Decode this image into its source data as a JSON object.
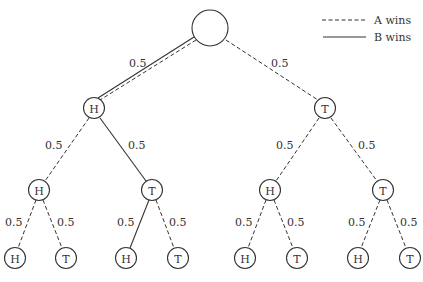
{
  "legend": {
    "items": [
      {
        "label": "A wins",
        "style": "dashed"
      },
      {
        "label": "B wins",
        "style": "solid"
      }
    ]
  },
  "tree": {
    "root": {
      "label": ""
    },
    "level1": [
      {
        "label": "H",
        "edge_prob": "0.5"
      },
      {
        "label": "T",
        "edge_prob": "0.5"
      }
    ],
    "level2": [
      {
        "label": "H",
        "edge_prob": "0.5"
      },
      {
        "label": "T",
        "edge_prob": "0.5"
      },
      {
        "label": "H",
        "edge_prob": "0.5"
      },
      {
        "label": "T",
        "edge_prob": "0.5"
      }
    ],
    "level3": [
      {
        "label": "H",
        "edge_prob": "0.5"
      },
      {
        "label": "T",
        "edge_prob": "0.5"
      },
      {
        "label": "H",
        "edge_prob": "0.5"
      },
      {
        "label": "T",
        "edge_prob": "0.5"
      },
      {
        "label": "H",
        "edge_prob": "0.5"
      },
      {
        "label": "T",
        "edge_prob": "0.5"
      },
      {
        "label": "H",
        "edge_prob": "0.5"
      },
      {
        "label": "T",
        "edge_prob": "0.5"
      }
    ]
  }
}
